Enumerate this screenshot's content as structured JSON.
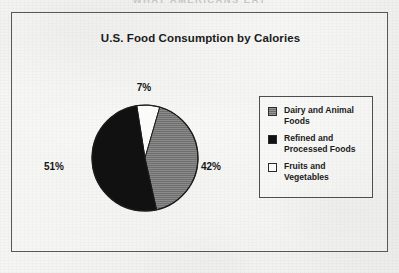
{
  "running_header": "WHAT AMERICANS EAT",
  "chart_title": "U.S. Food Consumption by Calories",
  "labels": {
    "top": "7%",
    "right": "42%",
    "left": "51%"
  },
  "legend": {
    "items": [
      {
        "label": "Dairy and Animal Foods",
        "swatch": "gray-swatch-icon",
        "color": "#6d6d6d"
      },
      {
        "label": "Refined and Processed Foods",
        "swatch": "black-swatch-icon",
        "color": "#111111"
      },
      {
        "label": "Fruits and Vegetables",
        "swatch": "white-swatch-icon",
        "color": "#fbfbfa"
      }
    ]
  },
  "chart_data": {
    "type": "pie",
    "title": "U.S. Food Consumption by Calories",
    "xlabel": "",
    "ylabel": "",
    "grid": false,
    "legend_position": "right",
    "units": "percent of calories",
    "slices": [
      {
        "label": "Fruits and Vegetables",
        "value": 7,
        "data_label": "7%",
        "color": "#fbfbfa",
        "label_position": "top"
      },
      {
        "label": "Dairy and Animal Foods",
        "value": 42,
        "data_label": "42%",
        "color": "#6d6d6d",
        "label_position": "right"
      },
      {
        "label": "Refined and Processed Foods",
        "value": 51,
        "data_label": "51%",
        "color": "#111111",
        "label_position": "left"
      }
    ],
    "total": 100,
    "start_angle_deg": -9,
    "direction": "clockwise"
  }
}
